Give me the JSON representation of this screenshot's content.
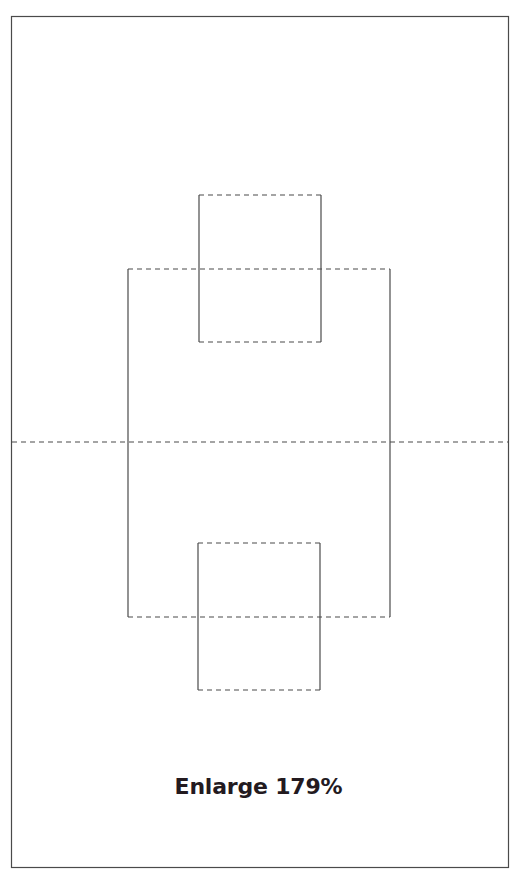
{
  "diagram": {
    "type": "papercraft-pattern",
    "colors": {
      "background": "#ffffff",
      "stroke": "#4a4a4a",
      "caption": "#231a1f"
    },
    "outer_frame": {
      "x": 11,
      "y": 16,
      "w": 498,
      "h": 852,
      "line": "solid"
    },
    "fold_line_center": {
      "y": 442,
      "x1": 11,
      "x2": 509,
      "line": "dashed"
    },
    "shapes": [
      {
        "name": "top-small-box",
        "x": 199,
        "y": 195,
        "w": 122,
        "h": 147,
        "sides": "left/right solid, top/bottom dashed"
      },
      {
        "name": "large-box",
        "x": 128,
        "y": 269,
        "w": 262,
        "h": 348,
        "sides": "left/right solid, top/bottom dashed"
      },
      {
        "name": "bottom-small-box",
        "x": 198,
        "y": 543,
        "w": 122,
        "h": 147,
        "sides": "left/right solid, top/bottom dashed"
      }
    ]
  },
  "caption": {
    "text": "Enlarge 179%"
  }
}
